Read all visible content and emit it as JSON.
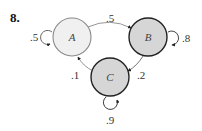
{
  "problem": {
    "number": "8."
  },
  "diagram": {
    "type": "markov-chain-state-diagram",
    "states": [
      {
        "id": "A",
        "label": "A",
        "fill": "#f0f0f0",
        "stroke": "#8a8a8a"
      },
      {
        "id": "B",
        "label": "B",
        "fill": "#d6d6d6",
        "stroke": "#222222"
      },
      {
        "id": "C",
        "label": "C",
        "fill": "#d6d6d6",
        "stroke": "#222222"
      }
    ],
    "transitions": [
      {
        "from": "A",
        "to": "A",
        "label": ".5"
      },
      {
        "from": "A",
        "to": "B",
        "label": ".5"
      },
      {
        "from": "B",
        "to": "B",
        "label": ".8"
      },
      {
        "from": "B",
        "to": "C",
        "label": ".2"
      },
      {
        "from": "C",
        "to": "C",
        "label": ".9"
      },
      {
        "from": "C",
        "to": "A",
        "label": ".1"
      }
    ]
  }
}
